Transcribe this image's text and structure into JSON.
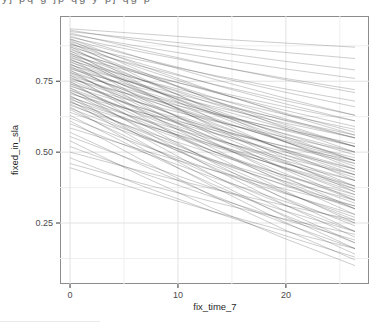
{
  "figure": {
    "width": 384,
    "height": 328,
    "background": "#ffffff",
    "clipped_top_text": "yj  pq  g  jp  qg  y  pj  qg  p"
  },
  "chart_data": {
    "type": "line",
    "title": "",
    "xlabel": "fix_time_7",
    "ylabel": "fixed_in_sla",
    "legend": "none",
    "grid": "on",
    "xlim": [
      -0.93,
      27.7
    ],
    "ylim": [
      0.035,
      0.98
    ],
    "x_ticks": [
      0,
      10,
      20
    ],
    "x_tick_labels": [
      "0",
      "10",
      "20"
    ],
    "y_ticks": [
      0.25,
      0.5,
      0.75
    ],
    "y_tick_labels": [
      "0.25",
      "0.50",
      "0.75"
    ],
    "x_minor_gridlines": [
      5,
      15,
      25
    ],
    "y_minor_gridlines": [
      0.125,
      0.375,
      0.625,
      0.875
    ],
    "line_x_range": [
      0,
      26.4
    ],
    "lines": [
      [
        0.935,
        0.87
      ],
      [
        0.93,
        0.79
      ],
      [
        0.925,
        0.83
      ],
      [
        0.92,
        0.71
      ],
      [
        0.915,
        0.76
      ],
      [
        0.91,
        0.63
      ],
      [
        0.905,
        0.72
      ],
      [
        0.9,
        0.56
      ],
      [
        0.898,
        0.66
      ],
      [
        0.895,
        0.5
      ],
      [
        0.89,
        0.61
      ],
      [
        0.887,
        0.44
      ],
      [
        0.883,
        0.57
      ],
      [
        0.88,
        0.68
      ],
      [
        0.877,
        0.52
      ],
      [
        0.873,
        0.4
      ],
      [
        0.87,
        0.63
      ],
      [
        0.866,
        0.47
      ],
      [
        0.862,
        0.55
      ],
      [
        0.858,
        0.36
      ],
      [
        0.855,
        0.59
      ],
      [
        0.85,
        0.45
      ],
      [
        0.848,
        0.52
      ],
      [
        0.845,
        0.38
      ],
      [
        0.84,
        0.61
      ],
      [
        0.837,
        0.47
      ],
      [
        0.833,
        0.55
      ],
      [
        0.83,
        0.33
      ],
      [
        0.827,
        0.49
      ],
      [
        0.823,
        0.58
      ],
      [
        0.82,
        0.42
      ],
      [
        0.817,
        0.52
      ],
      [
        0.813,
        0.3
      ],
      [
        0.81,
        0.46
      ],
      [
        0.807,
        0.56
      ],
      [
        0.803,
        0.37
      ],
      [
        0.8,
        0.5
      ],
      [
        0.797,
        0.43
      ],
      [
        0.793,
        0.55
      ],
      [
        0.79,
        0.28
      ],
      [
        0.787,
        0.47
      ],
      [
        0.783,
        0.35
      ],
      [
        0.78,
        0.52
      ],
      [
        0.777,
        0.41
      ],
      [
        0.773,
        0.25
      ],
      [
        0.77,
        0.48
      ],
      [
        0.766,
        0.33
      ],
      [
        0.762,
        0.44
      ],
      [
        0.758,
        0.53
      ],
      [
        0.755,
        0.38
      ],
      [
        0.75,
        0.22
      ],
      [
        0.747,
        0.42
      ],
      [
        0.743,
        0.3
      ],
      [
        0.74,
        0.5
      ],
      [
        0.736,
        0.36
      ],
      [
        0.732,
        0.46
      ],
      [
        0.728,
        0.2
      ],
      [
        0.725,
        0.4
      ],
      [
        0.72,
        0.32
      ],
      [
        0.717,
        0.44
      ],
      [
        0.713,
        0.26
      ],
      [
        0.71,
        0.37
      ],
      [
        0.705,
        0.47
      ],
      [
        0.7,
        0.18
      ],
      [
        0.697,
        0.34
      ],
      [
        0.693,
        0.42
      ],
      [
        0.69,
        0.24
      ],
      [
        0.686,
        0.38
      ],
      [
        0.682,
        0.16
      ],
      [
        0.678,
        0.3
      ],
      [
        0.675,
        0.4
      ],
      [
        0.67,
        0.27
      ],
      [
        0.665,
        0.35
      ],
      [
        0.66,
        0.14
      ],
      [
        0.655,
        0.31
      ],
      [
        0.65,
        0.22
      ],
      [
        0.64,
        0.33
      ],
      [
        0.63,
        0.18
      ],
      [
        0.62,
        0.28
      ],
      [
        0.61,
        0.12
      ],
      [
        0.6,
        0.25
      ],
      [
        0.585,
        0.31
      ],
      [
        0.57,
        0.16
      ],
      [
        0.555,
        0.22
      ],
      [
        0.54,
        0.1
      ],
      [
        0.52,
        0.19
      ],
      [
        0.5,
        0.26
      ],
      [
        0.48,
        0.13
      ],
      [
        0.46,
        0.21
      ],
      [
        0.445,
        0.16
      ]
    ],
    "style": {
      "line_color": "#333333",
      "line_opacity": 0.28,
      "line_width": 0.9,
      "grid_major_color": "#e2e2e2",
      "grid_minor_color": "#efefef",
      "panel_border_color": "#8c8c8c",
      "tick_mark_color": "#333333",
      "tick_label_color": "#4a4a4a",
      "axis_title_color": "#1f1f1f"
    },
    "plot_area_px": {
      "left": 60,
      "top": 16,
      "right": 369,
      "bottom": 284
    }
  }
}
